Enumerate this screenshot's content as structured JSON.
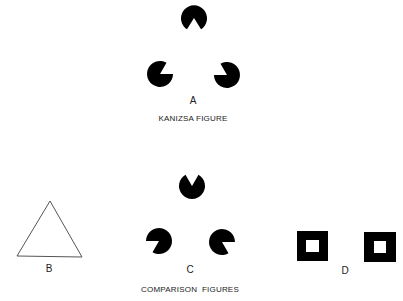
{
  "figures": {
    "A": {
      "letter": "A",
      "caption": "KANIZSA FIGURE"
    },
    "B": {
      "letter": "B"
    },
    "C": {
      "letter": "C",
      "caption": "COMPARISON  FIGURES"
    },
    "D": {
      "letter": "D"
    }
  },
  "colors": {
    "ink": "#000000",
    "background": "#ffffff",
    "outline": "#555555"
  }
}
